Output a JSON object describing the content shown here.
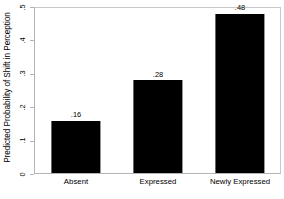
{
  "chart_data": {
    "type": "bar",
    "title": "",
    "subtitle": "",
    "xlabel": "",
    "ylabel": "Predicted Probability of Shift in Perception",
    "categories": [
      "Absent",
      "Expressed",
      "Newly Expressed"
    ],
    "values": [
      0.16,
      0.28,
      0.48
    ],
    "value_labels": [
      ".16",
      ".28",
      ".48"
    ],
    "ylim": [
      0,
      0.5
    ],
    "yticks": [
      0,
      0.1,
      0.2,
      0.3,
      0.4,
      0.5
    ],
    "ytick_labels": [
      "0",
      ".1",
      ".2",
      ".3",
      ".4",
      ".5"
    ],
    "grid": false,
    "legend": null,
    "bar_color": "#000000",
    "frame_color": "#c8c8c8",
    "axis_color": "#b4b4b4",
    "background_color": "#ffffff"
  }
}
